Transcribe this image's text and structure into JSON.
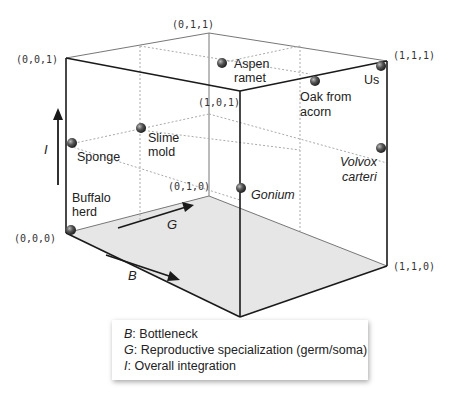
{
  "vertices": [
    {
      "label": "(0,0,1)",
      "x": 16,
      "y": 63
    },
    {
      "label": "(0,1,1)",
      "x": 175,
      "y": 28
    },
    {
      "label": "(1,1,1)",
      "x": 393,
      "y": 60
    },
    {
      "label": "(1,0,1)",
      "x": 200,
      "y": 107
    },
    {
      "label": "(0,1,0)",
      "x": 170,
      "y": 190
    },
    {
      "label": "(0,0,0)",
      "x": 14,
      "y": 241
    },
    {
      "label": "(1,1,0)",
      "x": 393,
      "y": 270
    },
    {
      "label": "(1,0,0)",
      "x": 205,
      "y": 328
    }
  ],
  "organisms": [
    {
      "name": "Aspen\nramet",
      "lines": [
        "Aspen",
        "ramet"
      ],
      "italic": false
    },
    {
      "name": "Oak from acorn",
      "lines": [
        "Oak from",
        "acorn"
      ],
      "italic": false
    },
    {
      "name": "Us",
      "lines": [
        "Us"
      ],
      "italic": false
    },
    {
      "name": "Slime mold",
      "lines": [
        "Slime",
        "mold"
      ],
      "italic": false
    },
    {
      "name": "Sponge",
      "lines": [
        "Sponge"
      ],
      "italic": false
    },
    {
      "name": "Volvox carteri",
      "lines": [
        "Volvox",
        "carteri"
      ],
      "italic": true
    },
    {
      "name": "Gonium",
      "lines": [
        "Gonium"
      ],
      "italic": true
    },
    {
      "name": "Buffalo herd",
      "lines": [
        "Buffalo",
        "herd"
      ],
      "italic": false
    }
  ],
  "axes": {
    "I": "I",
    "G": "G",
    "B": "B"
  },
  "legend": {
    "items": [
      {
        "key": "B",
        "text": ": Bottleneck"
      },
      {
        "key": "G",
        "text": ": Reproductive specialization (germ/soma)"
      },
      {
        "key": "I",
        "text": ": Overall integration"
      }
    ]
  },
  "colors": {
    "edge": "#1a1a1a",
    "floor": "#e6e6e6",
    "dotted": "#aaaaaa",
    "ball": "#555555"
  }
}
